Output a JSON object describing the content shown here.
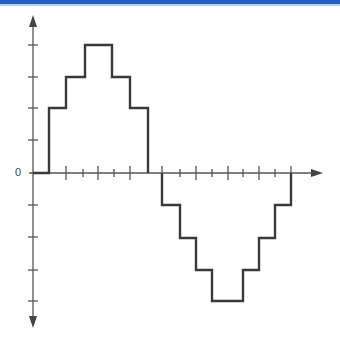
{
  "header": {
    "bar_color": "#1f5fbf"
  },
  "diagram": {
    "title": "",
    "type": "stepped-waveform",
    "axis": {
      "zero_label": "0",
      "origin_px": [
        33,
        173
      ],
      "x_arrow_end_px": 323,
      "y_arrow_top_px": 15,
      "y_arrow_bottom_px": 328,
      "y_ticks_px": [
        45,
        77,
        108,
        140,
        205,
        237,
        270,
        301
      ],
      "x_major_ticks_px": [
        66,
        98,
        130,
        162,
        196,
        228,
        259,
        291
      ],
      "x_minor_ticks_px": [
        83,
        114,
        180,
        212,
        243,
        275
      ]
    },
    "line_color": "#3a3a3a",
    "axis_color": "#555555"
  },
  "chart_data": {
    "type": "line",
    "title": "",
    "xlabel": "",
    "ylabel": "",
    "step": true,
    "x": [
      0,
      1,
      2,
      3,
      4,
      5,
      6,
      7,
      8,
      9,
      10,
      11,
      12,
      13,
      14,
      15
    ],
    "values": [
      0,
      2,
      3,
      4,
      4,
      3,
      2,
      0,
      -1,
      -2,
      -3,
      -4,
      -4,
      -3,
      -2,
      -1
    ],
    "levels_px": {
      "4": 45,
      "3": 77,
      "2": 108,
      "0": 173,
      "-1": 205,
      "-2": 238,
      "-3": 270,
      "-4": 301
    },
    "positive_half_px": [
      [
        33,
        173
      ],
      [
        49,
        173
      ],
      [
        49,
        108
      ],
      [
        66,
        108
      ],
      [
        66,
        77
      ],
      [
        85,
        77
      ],
      [
        85,
        45
      ],
      [
        112,
        45
      ],
      [
        112,
        77
      ],
      [
        130,
        77
      ],
      [
        130,
        108
      ],
      [
        148,
        108
      ],
      [
        148,
        173
      ]
    ],
    "negative_half_px": [
      [
        162,
        173
      ],
      [
        162,
        205
      ],
      [
        180,
        205
      ],
      [
        180,
        238
      ],
      [
        196,
        238
      ],
      [
        196,
        270
      ],
      [
        212,
        270
      ],
      [
        212,
        301
      ],
      [
        243,
        301
      ],
      [
        243,
        270
      ],
      [
        259,
        270
      ],
      [
        259,
        238
      ],
      [
        275,
        238
      ],
      [
        275,
        205
      ],
      [
        291,
        205
      ],
      [
        291,
        173
      ]
    ],
    "ylim": [
      -4,
      4
    ],
    "grid": false,
    "legend": null
  }
}
